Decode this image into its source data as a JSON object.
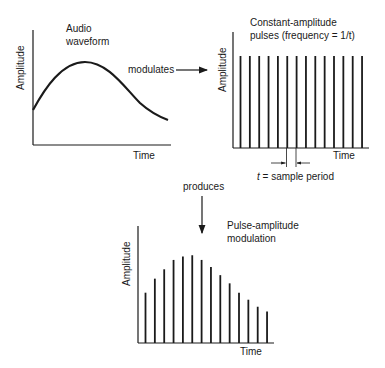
{
  "panels": {
    "audio": {
      "title_line1": "Audio",
      "title_line2": "waveform",
      "ylabel": "Amplitude",
      "xlabel": "Time"
    },
    "carrier": {
      "title_line1": "Constant-amplitude",
      "title_line2": "pulses (frequency = 1/t)",
      "ylabel": "Amplitude",
      "xlabel": "Time",
      "pulse_count": 14,
      "period_label_var": "t",
      "period_label_rest": " = sample period"
    },
    "pam": {
      "title_line1": "Pulse-amplitude",
      "title_line2": "modulation",
      "ylabel": "Amplitude",
      "xlabel": "Time"
    }
  },
  "connectors": {
    "modulates": "modulates",
    "produces": "produces"
  },
  "chart_data": [
    {
      "type": "line",
      "title": "Audio waveform",
      "xlabel": "Time",
      "ylabel": "Amplitude",
      "description": "Smooth curve rising from mid-low amplitude to a peak around 35% of the time axis, then decaying"
    },
    {
      "type": "bar",
      "title": "Constant-amplitude pulses (frequency = 1/t)",
      "xlabel": "Time",
      "ylabel": "Amplitude",
      "values": [
        1,
        1,
        1,
        1,
        1,
        1,
        1,
        1,
        1,
        1,
        1,
        1,
        1,
        1
      ],
      "annotation": "t = sample period"
    },
    {
      "type": "bar",
      "title": "Pulse-amplitude modulation",
      "xlabel": "Time",
      "ylabel": "Amplitude",
      "values": [
        0.43,
        0.55,
        0.63,
        0.71,
        0.74,
        0.75,
        0.71,
        0.65,
        0.58,
        0.51,
        0.43,
        0.37,
        0.31,
        0.27
      ]
    }
  ]
}
